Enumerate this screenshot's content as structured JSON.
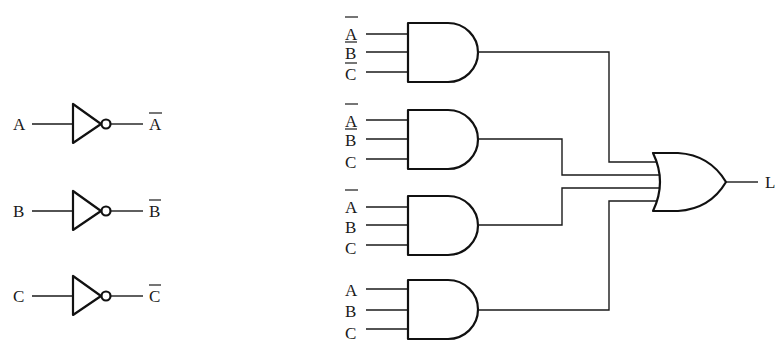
{
  "diagram": {
    "type": "combinational logic circuit",
    "inverters": [
      {
        "input": "A",
        "output": "A",
        "output_negated": true
      },
      {
        "input": "B",
        "output": "B",
        "output_negated": true
      },
      {
        "input": "C",
        "output": "C",
        "output_negated": true
      }
    ],
    "and_gates": [
      {
        "inputs": [
          {
            "label": "A",
            "negated": true
          },
          {
            "label": "B",
            "negated": true
          },
          {
            "label": "C",
            "negated": true
          }
        ]
      },
      {
        "inputs": [
          {
            "label": "A",
            "negated": true
          },
          {
            "label": "B",
            "negated": true
          },
          {
            "label": "C",
            "negated": false
          }
        ]
      },
      {
        "inputs": [
          {
            "label": "A",
            "negated": true
          },
          {
            "label": "B",
            "negated": false
          },
          {
            "label": "C",
            "negated": false
          }
        ]
      },
      {
        "inputs": [
          {
            "label": "A",
            "negated": false
          },
          {
            "label": "B",
            "negated": false
          },
          {
            "label": "C",
            "negated": false
          }
        ]
      }
    ],
    "or_gate": {
      "inputs": 4,
      "output": "L"
    },
    "colors": {
      "line": "#1a1a1a",
      "background": "#ffffff"
    }
  }
}
